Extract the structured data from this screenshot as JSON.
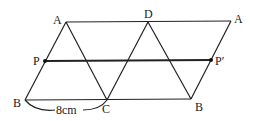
{
  "diagram": {
    "type": "geometry",
    "labels": {
      "A_left": "A",
      "D": "D",
      "A_right": "A",
      "P": "P",
      "P_prime": "P′",
      "B_left": "B",
      "C": "C",
      "B_right": "B",
      "measure": "8cm"
    },
    "points": {
      "A_left": [
        66,
        22
      ],
      "D": [
        148,
        22
      ],
      "A_right": [
        231,
        21
      ],
      "B_left": [
        25,
        100
      ],
      "C": [
        107,
        100
      ],
      "B_right": [
        191,
        99
      ],
      "P": [
        45,
        61
      ],
      "P_prime": [
        211,
        60
      ]
    },
    "colors": {
      "line": "#222222",
      "background": "#ffffff"
    }
  }
}
